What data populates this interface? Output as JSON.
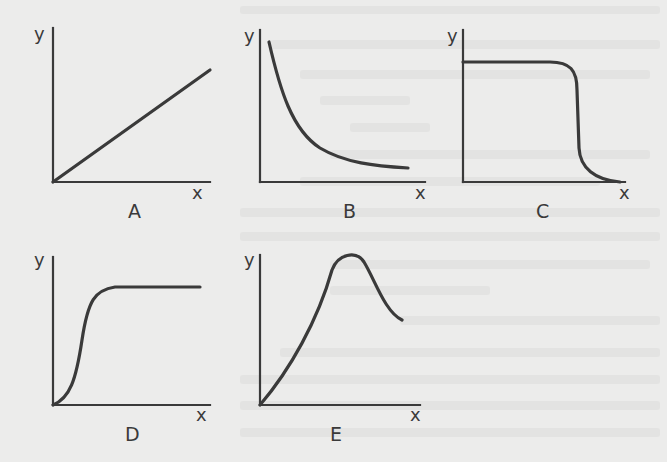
{
  "figure": {
    "panels": [
      {
        "id": "A",
        "label": "A",
        "x_label": "x",
        "y_label": "y",
        "shape": "linear-increasing"
      },
      {
        "id": "B",
        "label": "B",
        "x_label": "x",
        "y_label": "y",
        "shape": "inverse-decay"
      },
      {
        "id": "C",
        "label": "C",
        "x_label": "x",
        "y_label": "y",
        "shape": "plateau-then-sharp-drop"
      },
      {
        "id": "D",
        "label": "D",
        "x_label": "x",
        "y_label": "y",
        "shape": "sigmoid-saturation"
      },
      {
        "id": "E",
        "label": "E",
        "x_label": "x",
        "y_label": "y",
        "shape": "rise-peak-decline"
      }
    ],
    "colors": {
      "ink": "#3a3a3a",
      "paper": "#ececeb"
    }
  }
}
